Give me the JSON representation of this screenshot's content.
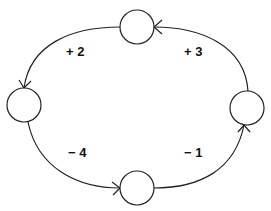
{
  "diagram": {
    "type": "cycle",
    "nodes": [
      {
        "id": "top",
        "label": ""
      },
      {
        "id": "left",
        "label": ""
      },
      {
        "id": "bottom",
        "label": ""
      },
      {
        "id": "right",
        "label": ""
      }
    ],
    "edges": [
      {
        "from": "top",
        "to": "left",
        "weight": "+ 2"
      },
      {
        "from": "left",
        "to": "bottom",
        "weight": "− 4"
      },
      {
        "from": "bottom",
        "to": "right",
        "weight": "− 1"
      },
      {
        "from": "right",
        "to": "top",
        "weight": "+ 3"
      }
    ],
    "labels": {
      "top_left": "+ 2",
      "top_right": "+ 3",
      "bottom_left": "− 4",
      "bottom_right": "− 1"
    },
    "colors": {
      "stroke": "#222222",
      "text": "#111111",
      "background": "#ffffff"
    }
  }
}
